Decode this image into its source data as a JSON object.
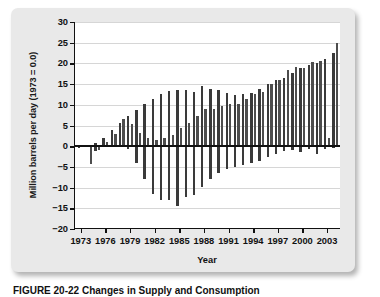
{
  "figure": {
    "caption": "FIGURE 20-22    Changes in Supply and Consumption"
  },
  "chart_data": {
    "type": "bar",
    "title": "",
    "xlabel": "Year",
    "ylabel": "Million barrels per day (1973 = 0.0)",
    "ylim": [
      -20,
      30
    ],
    "ytick_values": [
      30,
      25,
      20,
      15,
      10,
      5,
      0,
      -5,
      -10,
      -15,
      -20
    ],
    "ytick_labels": [
      "30",
      "25",
      "20",
      "15",
      "10",
      "5",
      "0",
      "−5",
      "−10",
      "−15",
      "−20"
    ],
    "xlim": [
      1972.3,
      2004.7
    ],
    "xtick_values": [
      1973,
      1976,
      1979,
      1982,
      1985,
      1988,
      1991,
      1994,
      1997,
      2000,
      2003
    ],
    "xtick_labels": [
      "1973",
      "1976",
      "1979",
      "1982",
      "1985",
      "1988",
      "1991",
      "1994",
      "1997",
      "2000",
      "2003"
    ],
    "grid": true,
    "legend": "none",
    "bar_color": "#3a3a3a",
    "x": [
      1973,
      1974,
      1975,
      1976,
      1977,
      1978,
      1979,
      1980,
      1981,
      1982,
      1983,
      1984,
      1985,
      1986,
      1987,
      1988,
      1989,
      1990,
      1991,
      1992,
      1993,
      1994,
      1995,
      1996,
      1997,
      1998,
      1999,
      2000,
      2001,
      2002,
      2003,
      2004
    ],
    "series": [
      {
        "name": "Series A",
        "values": [
          -0.4,
          -0.3,
          0.7,
          1.9,
          3.8,
          5.6,
          7.4,
          8.8,
          10.2,
          11.3,
          12.7,
          13.4,
          13.6,
          13.5,
          13.0,
          14.6,
          13.9,
          13.6,
          12.9,
          12.4,
          12.6,
          12.9,
          13.9,
          15.0,
          16.0,
          16.4,
          17.6,
          18.9,
          19.6,
          20.1,
          21.0,
          22.4
        ]
      },
      {
        "name": "Series B",
        "values": [
          -0.2,
          -4.2,
          -0.9,
          0.9,
          2.9,
          6.5,
          5.4,
          3.3,
          2.1,
          1.6,
          2.0,
          2.6,
          4.5,
          5.5,
          7.3,
          9.1,
          8.9,
          9.7,
          10.1,
          10.2,
          11.4,
          12.6,
          13.1,
          15.0,
          16.0,
          18.3,
          19.1,
          18.8,
          20.4,
          20.6,
          1.9,
          25.0
        ]
      },
      {
        "name": "Series C",
        "values": [
          0.0,
          0.0,
          -1.1,
          0.0,
          0.0,
          0.0,
          -0.6,
          -4.0,
          -8.0,
          -11.6,
          -12.9,
          -13.0,
          -14.4,
          -12.2,
          -11.7,
          -9.8,
          -8.0,
          -6.5,
          -5.6,
          -5.1,
          -4.6,
          -4.1,
          -3.5,
          -2.7,
          -1.8,
          -1.1,
          -0.9,
          -1.4,
          -0.7,
          -2.0,
          -0.6,
          -0.5
        ]
      }
    ]
  }
}
